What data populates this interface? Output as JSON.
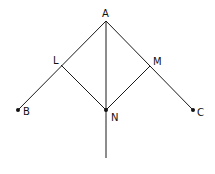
{
  "diagram": {
    "type": "geometry",
    "colors": {
      "stroke": "#1a1a1a",
      "background": "#ffffff"
    },
    "points": {
      "A": {
        "label": "A",
        "x": 106,
        "y": 21
      },
      "B": {
        "label": "B",
        "x": 18,
        "y": 110
      },
      "C": {
        "label": "C",
        "x": 193,
        "y": 110
      },
      "L": {
        "label": "L",
        "x": 61,
        "y": 65
      },
      "M": {
        "label": "M",
        "x": 150,
        "y": 66
      },
      "N": {
        "label": "N",
        "x": 106,
        "y": 110
      }
    },
    "segments": [
      [
        "A",
        "B"
      ],
      [
        "A",
        "C"
      ],
      [
        "L",
        "N"
      ],
      [
        "M",
        "N"
      ],
      [
        "A",
        "N"
      ]
    ],
    "ray": {
      "from": "A",
      "through": "N",
      "to_y": 158
    },
    "marked_points": [
      "B",
      "C",
      "N"
    ]
  }
}
